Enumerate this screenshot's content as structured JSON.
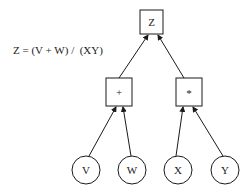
{
  "equation": "Z = (V + W) /  (XY)",
  "nodes": {
    "root": {
      "label": "Z",
      "shape": "box"
    },
    "plus": {
      "label": "+",
      "shape": "box"
    },
    "times": {
      "label": "*",
      "shape": "box"
    },
    "v": {
      "label": "V",
      "shape": "circle"
    },
    "w": {
      "label": "W",
      "shape": "circle"
    },
    "x": {
      "label": "X",
      "shape": "circle"
    },
    "y": {
      "label": "Y",
      "shape": "circle"
    }
  },
  "edges": [
    {
      "from": "plus",
      "to": "root"
    },
    {
      "from": "times",
      "to": "root"
    },
    {
      "from": "v",
      "to": "plus"
    },
    {
      "from": "w",
      "to": "plus"
    },
    {
      "from": "x",
      "to": "times"
    },
    {
      "from": "y",
      "to": "times"
    }
  ],
  "colors": {
    "stroke": "#1a1a1a",
    "background": "#ffffff"
  }
}
